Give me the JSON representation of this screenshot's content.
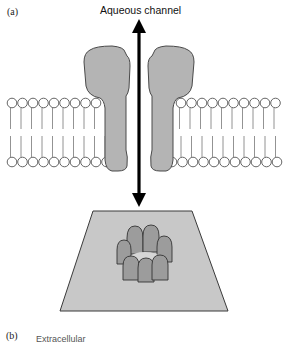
{
  "figure": {
    "panel_a_label": "(a)",
    "panel_b_label": "(b)",
    "panel_b_caption_partial": "Extracellular",
    "channel_label": "Aqueous channel",
    "colors": {
      "protein_fill": "#b4b4b4",
      "protein_stroke": "#4a4a4a",
      "plane_fill": "#c8c8c8",
      "subunit_fill": "#9c9c9c",
      "lipid_stroke": "#555555",
      "arrow": "#000000"
    },
    "membrane": {
      "left_heads_count": 9,
      "right_heads_count": 10
    },
    "pore": {
      "subunit_count": 8
    }
  }
}
